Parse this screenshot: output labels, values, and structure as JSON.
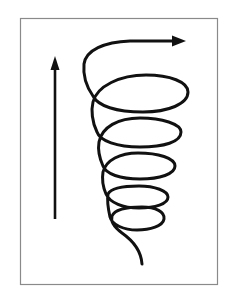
{
  "figure": {
    "colors": {
      "background": "#ffffff",
      "frame": "#8a8a8a",
      "stroke": "#111111"
    },
    "frame": {
      "x": 20,
      "y": 18,
      "width": 198,
      "height": 266
    },
    "vertical_arrow": {
      "x": 55,
      "tip_y": 56,
      "base_y": 219,
      "direction": "up"
    },
    "spiral": {
      "loops": 5,
      "direction": "upward, widening",
      "end_arrow": {
        "x": 184,
        "y": 42,
        "direction": "right"
      },
      "tail_end": {
        "x": 142,
        "y": 264
      }
    },
    "labels": {
      "vertical_arrow": "upward-arrow",
      "spiral": "expanding-helix"
    }
  }
}
